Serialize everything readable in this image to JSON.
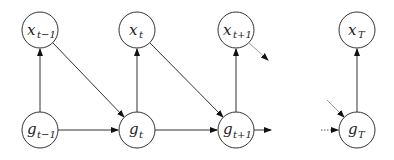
{
  "diagram": {
    "title": "",
    "nodes": [
      {
        "id": "x_tm1",
        "base": "x",
        "sub": "t−1"
      },
      {
        "id": "x_t",
        "base": "x",
        "sub": "t"
      },
      {
        "id": "x_tp1",
        "base": "x",
        "sub": "t+1"
      },
      {
        "id": "x_T",
        "base": "x",
        "sub": "T"
      },
      {
        "id": "g_tm1",
        "base": "g",
        "sub": "t−1"
      },
      {
        "id": "g_t",
        "base": "g",
        "sub": "t"
      },
      {
        "id": "g_tp1",
        "base": "g",
        "sub": "t+1"
      },
      {
        "id": "g_T",
        "base": "g",
        "sub": "T"
      }
    ],
    "edges": [
      {
        "from": "g_tm1",
        "to": "x_tm1",
        "style": "solid"
      },
      {
        "from": "g_t",
        "to": "x_t",
        "style": "solid"
      },
      {
        "from": "g_tp1",
        "to": "x_tp1",
        "style": "solid"
      },
      {
        "from": "g_T",
        "to": "x_T",
        "style": "solid"
      },
      {
        "from": "g_tm1",
        "to": "g_t",
        "style": "solid"
      },
      {
        "from": "g_t",
        "to": "g_tp1",
        "style": "solid"
      },
      {
        "from": "x_tm1",
        "to": "g_t",
        "style": "solid"
      },
      {
        "from": "x_t",
        "to": "g_tp1",
        "style": "solid"
      },
      {
        "from": "x_tp1",
        "to": "…",
        "style": "faint"
      },
      {
        "from": "g_tp1",
        "to": "…",
        "style": "stub"
      },
      {
        "from": "…",
        "to": "g_T",
        "style": "dotted"
      },
      {
        "from": "…",
        "to": "g_T",
        "style": "faint-diagonal"
      }
    ]
  }
}
